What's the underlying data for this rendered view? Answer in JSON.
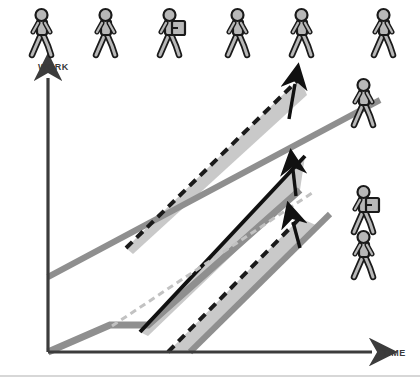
{
  "figure": {
    "background_color": "#ffffff",
    "width": 420,
    "height": 384
  },
  "axes": {
    "y_label": "WORK",
    "x_label": "TIME",
    "axis_color": "#3c3c3c",
    "origin": {
      "x": 48,
      "y": 352
    },
    "y_top": {
      "x": 48,
      "y": 78
    },
    "x_right": {
      "x": 372,
      "y": 352
    }
  },
  "colors": {
    "band_fill": "#c9c9c9",
    "gray_line": "#8f8f8f",
    "black_line": "#111111",
    "dashed_dark": "#1a1a1a",
    "dashed_light": "#c2c2c2",
    "person_fill": "#b8b8b8",
    "person_outline": "#1a1a1a",
    "footer_rule": "#b0b0b0"
  },
  "people_row": {
    "count": 6,
    "figures": [
      {
        "id": "walker-1",
        "x": 30,
        "y": 8,
        "has_bag": false
      },
      {
        "id": "walker-2",
        "x": 94,
        "y": 8,
        "has_bag": false
      },
      {
        "id": "walker-3",
        "x": 158,
        "y": 8,
        "has_bag": true
      },
      {
        "id": "walker-4",
        "x": 226,
        "y": 8,
        "has_bag": false
      },
      {
        "id": "walker-5",
        "x": 290,
        "y": 8,
        "has_bag": false
      },
      {
        "id": "walker-6",
        "x": 372,
        "y": 8,
        "has_bag": false
      }
    ]
  },
  "side_figures": [
    {
      "id": "side-walker-top",
      "x": 352,
      "y": 78,
      "has_bag": false
    },
    {
      "id": "side-walker-middle",
      "x": 352,
      "y": 185,
      "has_bag": true
    },
    {
      "id": "side-walker-bottom",
      "x": 352,
      "y": 230,
      "has_bag": false
    }
  ],
  "chart_data": {
    "type": "line",
    "xlabel": "TIME",
    "ylabel": "WORK",
    "grid": false,
    "legend": "none",
    "xlim": [
      48,
      380
    ],
    "ylim": [
      352,
      78
    ],
    "note": "Coordinates are in screen pixels; y decreases upward.",
    "series": [
      {
        "name": "upper-gray-trend",
        "style": "solid",
        "color": "#8f8f8f",
        "width": 6,
        "points": [
          [
            48,
            277
          ],
          [
            380,
            100
          ]
        ]
      },
      {
        "name": "upper-dashed-potential",
        "style": "dashed",
        "color": "#1a1a1a",
        "width": 4,
        "points": [
          [
            126,
            248
          ],
          [
            300,
            78
          ]
        ]
      },
      {
        "name": "upper-gap-band",
        "style": "filled-band",
        "color": "#c9c9c9",
        "points": [
          [
            126,
            248
          ],
          [
            300,
            78
          ],
          [
            307,
            95
          ],
          [
            133,
            254
          ]
        ]
      },
      {
        "name": "upper-gap-arrow",
        "style": "arrow",
        "color": "#111111",
        "points": [
          [
            289,
            119
          ],
          [
            295,
            84
          ]
        ]
      },
      {
        "name": "lower-gray-stepped-trend",
        "style": "solid",
        "color": "#8f8f8f",
        "width": 7,
        "points": [
          [
            48,
            352
          ],
          [
            110,
            325
          ],
          [
            148,
            325
          ],
          [
            300,
            190
          ]
        ]
      },
      {
        "name": "black-accelerated-trend",
        "style": "solid",
        "color": "#111111",
        "width": 4,
        "points": [
          [
            140,
            332
          ],
          [
            305,
            156
          ]
        ]
      },
      {
        "name": "light-dashed-baseline",
        "style": "dashed",
        "color": "#c2c2c2",
        "width": 3,
        "points": [
          [
            112,
            326
          ],
          [
            312,
            193
          ]
        ]
      },
      {
        "name": "middle-gap-band",
        "style": "filled-band",
        "color": "#c9c9c9",
        "points": [
          [
            140,
            332
          ],
          [
            305,
            156
          ],
          [
            300,
            190
          ],
          [
            148,
            336
          ]
        ]
      },
      {
        "name": "middle-gap-arrow",
        "style": "arrow",
        "color": "#111111",
        "points": [
          [
            296,
            196
          ],
          [
            293,
            170
          ]
        ]
      },
      {
        "name": "lower-gray-secondary-trend",
        "style": "solid",
        "color": "#8f8f8f",
        "width": 6,
        "points": [
          [
            190,
            352
          ],
          [
            330,
            214
          ]
        ]
      },
      {
        "name": "lower-dashed-potential",
        "style": "dashed",
        "color": "#1a1a1a",
        "width": 4,
        "points": [
          [
            168,
            352
          ],
          [
            300,
            218
          ]
        ]
      },
      {
        "name": "lower-gap-band",
        "style": "filled-band",
        "color": "#c9c9c9",
        "points": [
          [
            168,
            352
          ],
          [
            300,
            218
          ],
          [
            318,
            226
          ],
          [
            190,
            352
          ]
        ]
      },
      {
        "name": "lower-gap-arrow",
        "style": "arrow",
        "color": "#111111",
        "points": [
          [
            300,
            248
          ],
          [
            293,
            222
          ]
        ]
      }
    ]
  },
  "footer": {
    "rule_visible": true,
    "rule_y": 376
  }
}
